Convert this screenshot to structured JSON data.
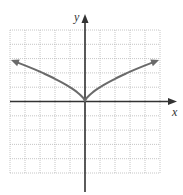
{
  "chart_data": {
    "type": "line",
    "title": "",
    "xlabel": "x",
    "ylabel": "y",
    "function": "y = x^(2/3)",
    "xlim": [
      -5,
      5
    ],
    "ylim": [
      -5,
      5
    ],
    "grid": true,
    "tick_labels": false,
    "series": [
      {
        "name": "curve",
        "x": [
          -4.9,
          -4,
          -3,
          -2,
          -1,
          -0.5,
          0,
          0.5,
          1,
          2,
          3,
          4,
          4.9
        ],
        "y": [
          2.88,
          2.52,
          2.08,
          1.59,
          1.0,
          0.63,
          0,
          0.63,
          1.0,
          1.59,
          2.08,
          2.52,
          2.88
        ],
        "arrows": "both ends"
      }
    ]
  },
  "colors": {
    "axis": "#333333",
    "curve": "#6b6b6b",
    "grid": "#b8b8b8"
  },
  "labels": {
    "x": "x",
    "y": "y"
  }
}
